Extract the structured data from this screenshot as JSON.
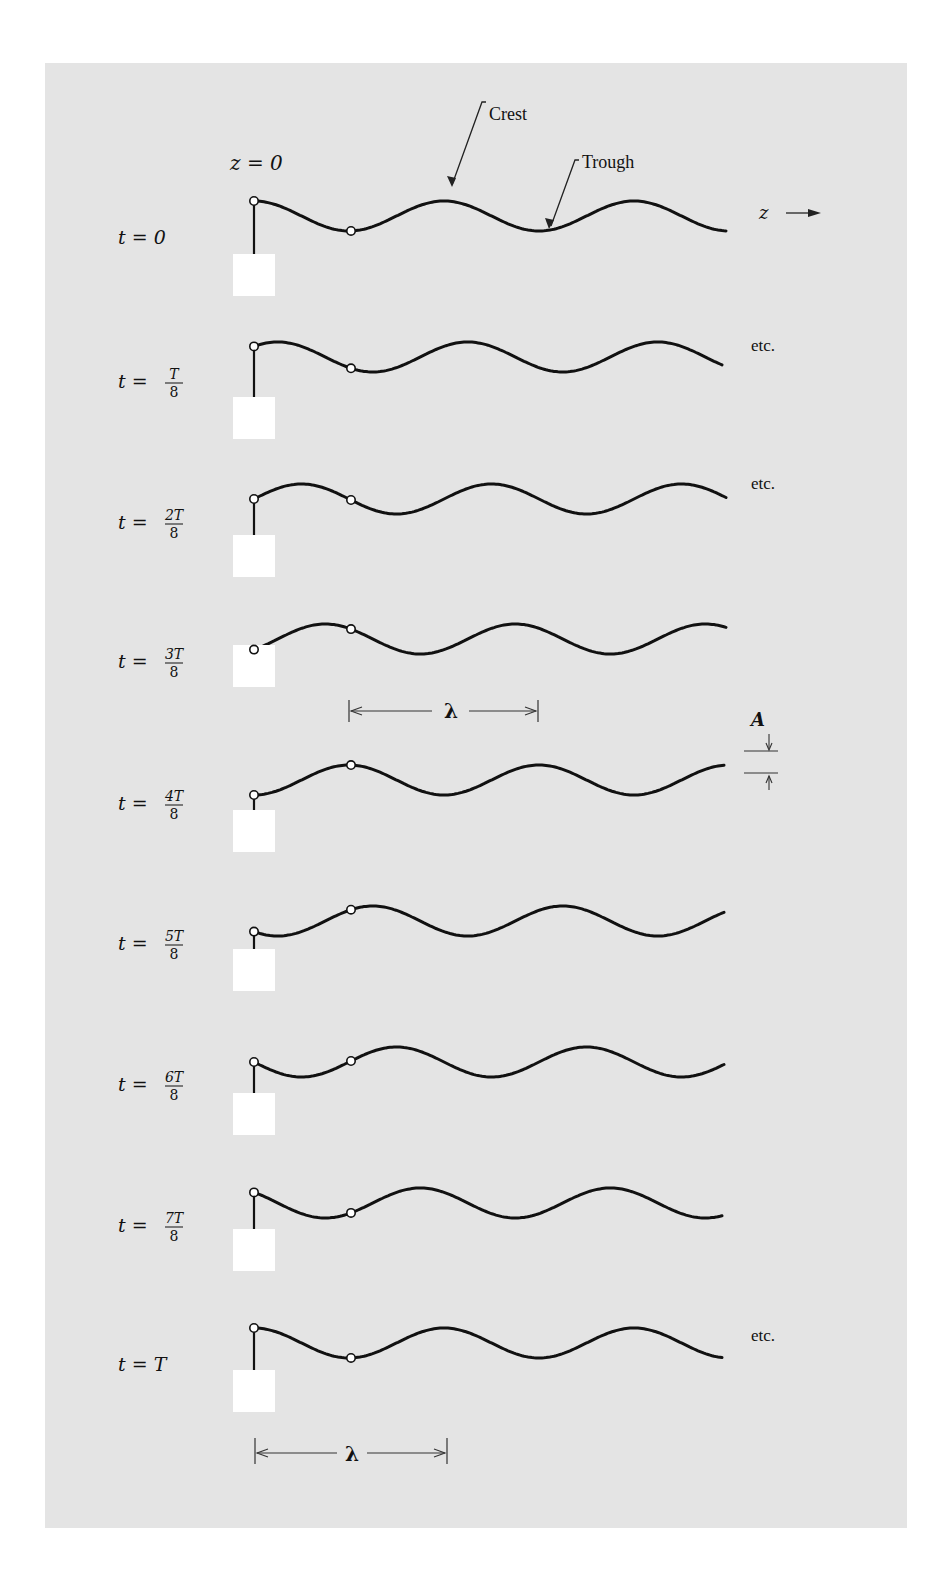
{
  "figure": {
    "top_label": "z = 0",
    "annotations": {
      "crest": "Crest",
      "trough": "Trough",
      "z_axis": "z",
      "amplitude": "A",
      "wavelength": "λ",
      "etc": "etc."
    },
    "colors": {
      "panel_background": "#e4e4e4",
      "page_background": "#ffffff",
      "ink": "#111111",
      "source_block": "#ffffff"
    }
  },
  "rows": [
    {
      "t_label": "t = 0",
      "num": "",
      "den": "",
      "frac": false,
      "etc": false
    },
    {
      "t_label": "t =",
      "num": "T",
      "den": "8",
      "frac": true,
      "etc": true
    },
    {
      "t_label": "t =",
      "num": "2T",
      "den": "8",
      "frac": true,
      "etc": true
    },
    {
      "t_label": "t =",
      "num": "3T",
      "den": "8",
      "frac": true,
      "etc": false
    },
    {
      "t_label": "t =",
      "num": "4T",
      "den": "8",
      "frac": true,
      "etc": false
    },
    {
      "t_label": "t =",
      "num": "5T",
      "den": "8",
      "frac": true,
      "etc": false
    },
    {
      "t_label": "t =",
      "num": "6T",
      "den": "8",
      "frac": true,
      "etc": false
    },
    {
      "t_label": "t =",
      "num": "7T",
      "den": "8",
      "frac": true,
      "etc": false
    },
    {
      "t_label": "t = T",
      "num": "",
      "den": "",
      "frac": false,
      "etc": true
    }
  ]
}
